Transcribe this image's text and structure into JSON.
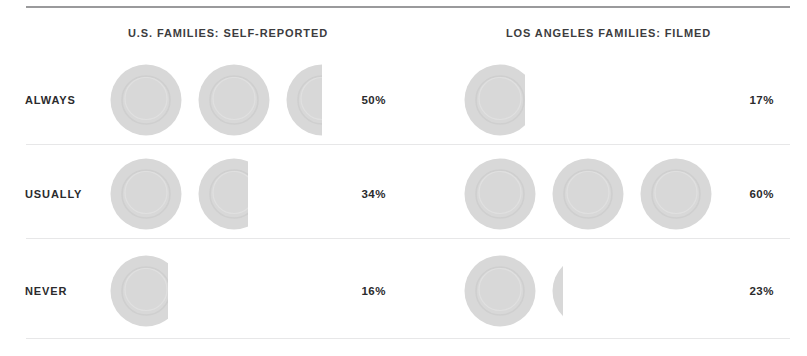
{
  "chart_data": {
    "type": "bar",
    "title": "",
    "subtitle": "",
    "xlabel": "",
    "ylabel": "",
    "categories": [
      "ALWAYS",
      "USUALLY",
      "NEVER"
    ],
    "series": [
      {
        "name": "U.S. FAMILIES: SELF-REPORTED",
        "values": [
          50,
          34,
          16
        ],
        "labels": [
          "50%",
          "34%",
          "16%"
        ]
      },
      {
        "name": "LOS ANGELES FAMILIES: FILMED",
        "values": [
          17,
          60,
          23
        ],
        "labels": [
          "17%",
          "60%",
          "23%"
        ]
      }
    ],
    "units": "percent",
    "pictogram": {
      "icon": "dinner-plate-icon",
      "unit_value": 20,
      "note": "each plate icon represents 20%; partial plates are clipped"
    },
    "grid": false,
    "legend_position": "top",
    "ylim": [
      0,
      100
    ]
  },
  "header": {
    "left_column": "U.S. FAMILIES: SELF-REPORTED",
    "right_column": "LOS ANGELES FAMILIES: FILMED"
  },
  "rows": [
    {
      "label": "ALWAYS",
      "left": {
        "percent": "50%",
        "plates": [
          1,
          1,
          0.5
        ]
      },
      "right": {
        "percent": "17%",
        "plates": [
          0.85
        ]
      }
    },
    {
      "label": "USUALLY",
      "left": {
        "percent": "34%",
        "plates": [
          1,
          0.7
        ]
      },
      "right": {
        "percent": "60%",
        "plates": [
          1,
          1,
          1
        ]
      }
    },
    {
      "label": "NEVER",
      "left": {
        "percent": "16%",
        "plates": [
          0.8
        ]
      },
      "right": {
        "percent": "23%",
        "plates": [
          1,
          0.15
        ]
      }
    }
  ],
  "colors": {
    "plate_fill": "#d8d8d8",
    "plate_rim": "#cfcfcf",
    "text_dark": "#2b2b2d",
    "text_header": "#3c3c3e",
    "rule_top": "#9a9a9c",
    "rule_light": "#e7e7e8",
    "background": "#ffffff"
  }
}
